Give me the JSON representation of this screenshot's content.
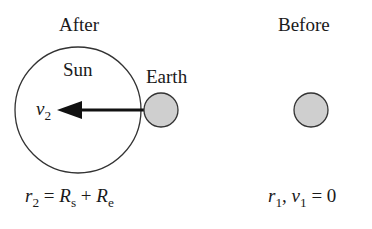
{
  "labels": {
    "after": "After",
    "before": "Before",
    "sun": "Sun",
    "earth": "Earth"
  },
  "velocity_label": {
    "symbol": "v",
    "sub": "2"
  },
  "after_equation": {
    "lhs": "r",
    "lhs_sub": "2",
    "eq": " = ",
    "t1": "R",
    "t1_sub": "s",
    "plus": " + ",
    "t2": "R",
    "t2_sub": "e"
  },
  "before_equation": {
    "r": "r",
    "r_sub": "1",
    "comma": ", ",
    "v": "v",
    "v_sub": "1",
    "eq": " = 0"
  },
  "colors": {
    "outline": "#333333",
    "earth_fill": "#cfcfcf",
    "arrow": "#111111"
  }
}
